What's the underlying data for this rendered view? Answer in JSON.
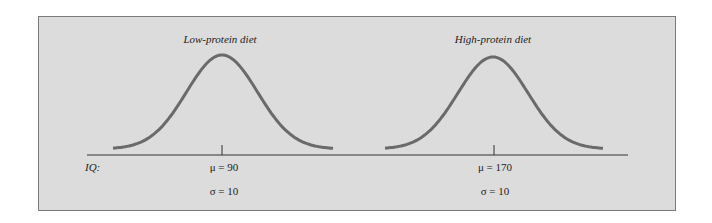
{
  "figure": {
    "axis_label": "IQ:",
    "distributions": [
      {
        "title": "Low-protein diet",
        "mean_label": "μ = 90",
        "sd_label": "σ = 10",
        "mean": 90,
        "sd": 10
      },
      {
        "title": "High-protein diet",
        "mean_label": "μ = 170",
        "sd_label": "σ = 10",
        "mean": 170,
        "sd": 10
      }
    ],
    "colors": {
      "panel": "#dcdcdc",
      "curve": "#666666",
      "axis": "#333333",
      "border": "#7a7a7a"
    }
  }
}
